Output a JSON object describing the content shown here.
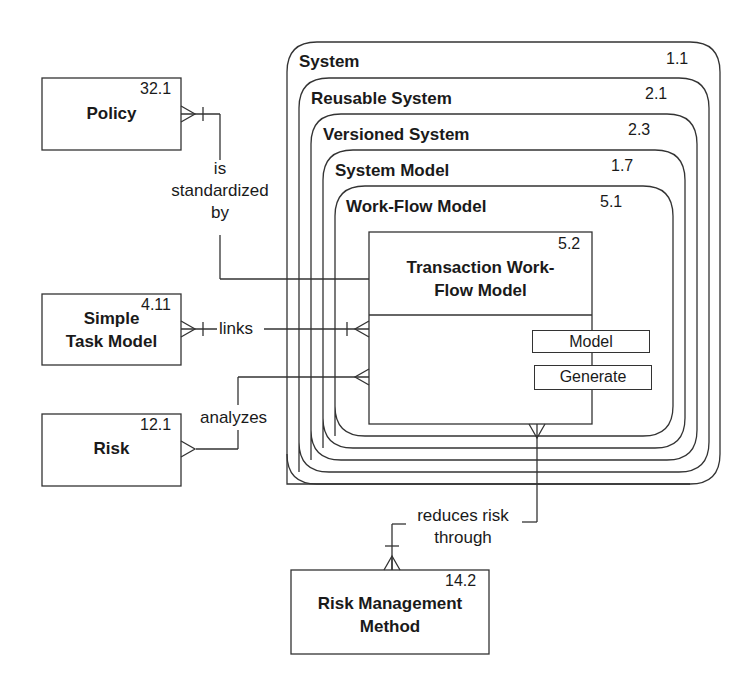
{
  "diagram": {
    "type": "entity-relationship / nested subtype diagram",
    "supertype_nest": [
      {
        "name": "System",
        "id": "1.1"
      },
      {
        "name": "Reusable System",
        "id": "2.1"
      },
      {
        "name": "Versioned System",
        "id": "2.3"
      },
      {
        "name": "System Model",
        "id": "1.7"
      },
      {
        "name": "Work-Flow Model",
        "id": "5.1"
      }
    ],
    "core_entity": {
      "name": "Transaction Work-Flow Model",
      "name_line1": "Transaction Work-",
      "name_line2": "Flow Model",
      "id": "5.2",
      "operations": [
        "Model",
        "Generate"
      ]
    },
    "entities": {
      "policy": {
        "name": "Policy",
        "id": "32.1"
      },
      "simple_task_model": {
        "name": "Simple Task Model",
        "line1": "Simple",
        "line2": "Task Model",
        "id": "4.11"
      },
      "risk": {
        "name": "Risk",
        "id": "12.1"
      },
      "risk_management_method": {
        "name": "Risk Management Method",
        "line1": "Risk Management",
        "line2": "Method",
        "id": "14.2"
      }
    },
    "relationships": {
      "standardized": {
        "line1": "is",
        "line2": "standardized",
        "line3": "by"
      },
      "links": {
        "label": "links"
      },
      "analyzes": {
        "label": "analyzes"
      },
      "reduces": {
        "line1": "reduces risk",
        "line2": "through"
      }
    },
    "colors": {
      "line": "#333333",
      "text": "#1a1a1a",
      "background": "#ffffff"
    }
  }
}
